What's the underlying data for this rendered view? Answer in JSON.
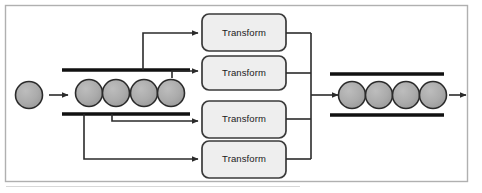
{
  "figure": {
    "frame": {
      "border_color": "#b0b0b0",
      "background": "#ffffff"
    },
    "colors": {
      "item_fill": "#a9a9a9",
      "item_stroke": "#2b2b2b",
      "box_fill": "#eeeeee",
      "box_stroke": "#3a3a3a",
      "pipe_rail": "#111111",
      "connector": "#2b2b2b",
      "frame": "#b0b0b0",
      "label_text": "#1a1a1a"
    }
  },
  "input_stream": {
    "name": "input-stream",
    "incoming_item_count": 1,
    "pipe_item_count": 4,
    "arrow_label": ""
  },
  "output_stream": {
    "name": "output-stream",
    "pipe_item_count": 4,
    "arrow_label": ""
  },
  "transforms": [
    {
      "id": "transform-1",
      "label": "Transform"
    },
    {
      "id": "transform-2",
      "label": "Transform"
    },
    {
      "id": "transform-3",
      "label": "Transform"
    },
    {
      "id": "transform-4",
      "label": "Transform"
    }
  ],
  "connectors": {
    "input_taps": 4,
    "output_merges": 4
  }
}
